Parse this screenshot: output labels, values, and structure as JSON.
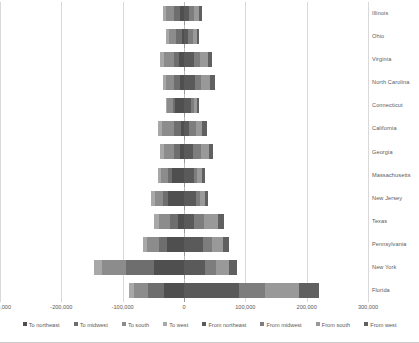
{
  "chart_data": {
    "type": "bar",
    "orientation": "horizontal",
    "stacked": true,
    "diverging": true,
    "title": "",
    "xlabel": "",
    "ylabel": "",
    "xlim": [
      -300000,
      300000
    ],
    "xticks": [
      -300000,
      -200000,
      -100000,
      0,
      100000,
      200000,
      300000
    ],
    "xtick_labels": [
      "-300,000",
      "-200,000",
      "-100,000",
      "0",
      "100,000",
      "200,000",
      "300,000"
    ],
    "grid": true,
    "legend_position": "bottom",
    "categories": [
      "Illinois",
      "Ohio",
      "Virginia",
      "North Carolina",
      "Connecticut",
      "California",
      "Georgia",
      "Massachusetts",
      "New Jersey",
      "Texas",
      "Pennsylvania",
      "New York",
      "Florida"
    ],
    "series": [
      {
        "name": "To northeast",
        "color": "#4f4f4f",
        "values": [
          -6000,
          -4000,
          -8000,
          -7000,
          -14000,
          -5000,
          -7000,
          -20000,
          -26000,
          -9000,
          -27000,
          -49000,
          -33000
        ]
      },
      {
        "name": "To midwest",
        "color": "#6e6e6e",
        "values": [
          -10000,
          -9000,
          -9000,
          -9000,
          -4000,
          -11000,
          -9000,
          -6000,
          -8000,
          -14000,
          -13000,
          -46000,
          -26000
        ]
      },
      {
        "name": "To south",
        "color": "#8c8c8c",
        "values": [
          -13000,
          -12000,
          -16000,
          -14000,
          -9000,
          -20000,
          -17000,
          -11000,
          -14000,
          -18000,
          -20000,
          -38000,
          -22000
        ]
      },
      {
        "name": "To west",
        "color": "#a8a8a8",
        "values": [
          -5000,
          -4000,
          -6000,
          -5000,
          -3000,
          -7000,
          -6000,
          -5000,
          -5000,
          -8000,
          -7000,
          -13000,
          -9000
        ]
      },
      {
        "name": "From northeast",
        "color": "#5a5a5a",
        "values": [
          8000,
          7000,
          17000,
          18000,
          12000,
          9000,
          15000,
          16000,
          19000,
          17000,
          31000,
          34000,
          90000
        ]
      },
      {
        "name": "From midwest",
        "color": "#7d7d7d",
        "values": [
          9000,
          8000,
          9000,
          10000,
          4000,
          10000,
          12000,
          6000,
          7000,
          16000,
          15000,
          18000,
          42000
        ]
      },
      {
        "name": "From south",
        "color": "#999999",
        "values": [
          7000,
          6000,
          13000,
          15000,
          5000,
          11000,
          14000,
          7000,
          8000,
          22000,
          18000,
          22000,
          56000
        ]
      },
      {
        "name": "From west",
        "color": "#606060",
        "values": [
          5000,
          4000,
          6000,
          7000,
          3000,
          8000,
          7000,
          5000,
          5000,
          10000,
          9000,
          12000,
          33000
        ]
      }
    ]
  },
  "axis": {
    "tick_labels": [
      "-300,000",
      "-200,000",
      "-100,000",
      "0",
      "100,000",
      "200,000",
      "300,000"
    ]
  },
  "legend": {
    "items": [
      {
        "label": "To northeast",
        "color": "#4f4f4f"
      },
      {
        "label": "To midwest",
        "color": "#6e6e6e"
      },
      {
        "label": "To south",
        "color": "#8c8c8c"
      },
      {
        "label": "To west",
        "color": "#a8a8a8"
      },
      {
        "label": "From northeast",
        "color": "#5a5a5a"
      },
      {
        "label": "From midwest",
        "color": "#7d7d7d"
      },
      {
        "label": "From south",
        "color": "#999999"
      },
      {
        "label": "From west",
        "color": "#606060"
      }
    ]
  }
}
